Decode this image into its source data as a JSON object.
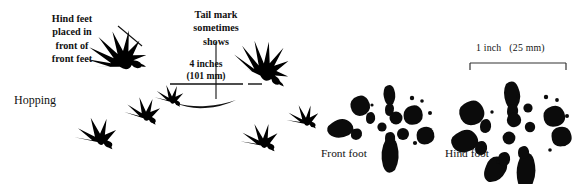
{
  "figure": {
    "background_color": "#ffffff",
    "ink_color": "#000000",
    "width": 579,
    "height": 184
  },
  "labels": {
    "hind_feet_placement": "Hind feet\nplaced in\nfront of\nfront feet",
    "tail_mark": "Tail mark\nsometimes\nshows",
    "measurement": "4 inches\n(101 mm)",
    "gait": "Hopping",
    "scale_bar": "1 inch   (25 mm)",
    "front_foot": "Front foot",
    "hind_foot": "Hind foot"
  },
  "measurements": {
    "stride_inches": "4 inches",
    "stride_mm": "(101 mm)",
    "scale_inches": "1 inch",
    "scale_mm": "(25 mm)"
  },
  "track_groups": [
    {
      "name": "hopping-group-1",
      "hind_tracks": 1,
      "front_tracks": 1
    },
    {
      "name": "hopping-group-2",
      "hind_tracks": 1,
      "front_tracks": 2
    },
    {
      "name": "hopping-group-3",
      "hind_tracks": 1,
      "front_tracks": 2
    }
  ],
  "detail_prints": [
    {
      "name": "front-foot-print",
      "label": "Front foot",
      "toes": 4
    },
    {
      "name": "hind-foot-print",
      "label": "Hind foot",
      "toes": 5
    }
  ]
}
